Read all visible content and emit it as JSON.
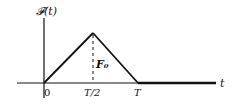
{
  "diagram": {
    "type": "triangular-pulse",
    "y_axis_label": "𝓕(t)",
    "x_axis_label": "t",
    "x_ticks": [
      "0",
      "T/2",
      "T"
    ],
    "peak_label": "F₀",
    "ink_color": "#111111",
    "background": "#ffffff"
  }
}
